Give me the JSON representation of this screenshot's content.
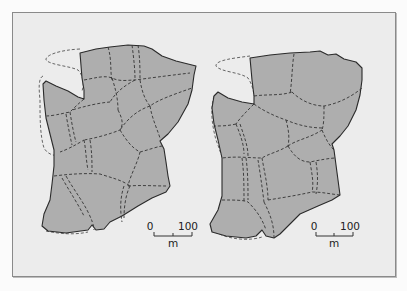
{
  "figure": {
    "background": "#ececec",
    "region_fill": "#aeaeae",
    "panels": [
      {
        "id": "left",
        "scale_bar": {
          "start_label": "0",
          "end_label": "100",
          "unit_label": "m"
        }
      },
      {
        "id": "right",
        "scale_bar": {
          "start_label": "0",
          "end_label": "100",
          "unit_label": "m"
        }
      }
    ]
  }
}
